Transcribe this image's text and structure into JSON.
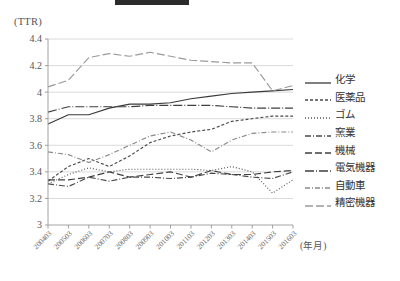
{
  "redaction": {
    "present": true
  },
  "axis": {
    "y_unit_label": "(TTR)",
    "x_unit_label": "(年月)",
    "y_ticks": [
      "4.4",
      "4.2",
      "4",
      "3.8",
      "3.6",
      "3.4",
      "3.2",
      "3"
    ],
    "x_ticks": [
      "200403",
      "200503",
      "200603",
      "200703",
      "200803",
      "200903",
      "201003",
      "201103",
      "201203",
      "201303",
      "201403",
      "201503",
      "201603"
    ]
  },
  "legend": {
    "items": [
      {
        "label": "化学",
        "key": "solid"
      },
      {
        "label": "医薬品",
        "key": "dashed-short"
      },
      {
        "label": "ゴム",
        "key": "dotted"
      },
      {
        "label": "窯業",
        "key": "dash-dot"
      },
      {
        "label": "機械",
        "key": "dashed-long"
      },
      {
        "label": "電気機器",
        "key": "long-dash-dot"
      },
      {
        "label": "自動車",
        "key": "dash-dot-gray"
      },
      {
        "label": "精密機器",
        "key": "dashed-wide-gray"
      }
    ]
  },
  "chart_data": {
    "type": "line",
    "title": "",
    "xlabel": "(年月)",
    "ylabel": "(TTR)",
    "ylim": [
      3.0,
      4.4
    ],
    "grid": true,
    "legend_position": "right",
    "x": [
      "200403",
      "200503",
      "200603",
      "200703",
      "200803",
      "200903",
      "201003",
      "201103",
      "201203",
      "201303",
      "201403",
      "201503",
      "201603"
    ],
    "series": [
      {
        "name": "化学",
        "color": "#3a3a3a",
        "dash": "none",
        "values": [
          3.76,
          3.83,
          3.83,
          3.88,
          3.91,
          3.91,
          3.92,
          3.95,
          3.97,
          3.99,
          4.0,
          4.01,
          4.02
        ]
      },
      {
        "name": "医薬品",
        "color": "#4a4a4a",
        "dash": "3,2",
        "values": [
          3.33,
          3.44,
          3.5,
          3.44,
          3.52,
          3.62,
          3.67,
          3.7,
          3.72,
          3.78,
          3.8,
          3.82,
          3.82
        ]
      },
      {
        "name": "ゴム",
        "color": "#555555",
        "dash": "1,2",
        "values": [
          3.31,
          3.38,
          3.43,
          3.4,
          3.42,
          3.42,
          3.42,
          3.42,
          3.41,
          3.44,
          3.4,
          3.24,
          3.34
        ]
      },
      {
        "name": "窯業",
        "color": "#4a4a4a",
        "dash": "6,2,1,2",
        "values": [
          3.31,
          3.29,
          3.36,
          3.33,
          3.36,
          3.36,
          3.35,
          3.36,
          3.39,
          3.38,
          3.36,
          3.35,
          3.4
        ]
      },
      {
        "name": "機械",
        "color": "#3f3f3f",
        "dash": "7,3",
        "values": [
          3.34,
          3.34,
          3.36,
          3.4,
          3.36,
          3.38,
          3.4,
          3.36,
          3.41,
          3.38,
          3.38,
          3.4,
          3.41
        ]
      },
      {
        "name": "電気機器",
        "color": "#3f3f3f",
        "dash": "9,2,1,2",
        "values": [
          3.85,
          3.89,
          3.89,
          3.89,
          3.89,
          3.9,
          3.9,
          3.9,
          3.9,
          3.89,
          3.88,
          3.88,
          3.88
        ]
      },
      {
        "name": "自動車",
        "color": "#8a8a8a",
        "dash": "5,2,1,2",
        "values": [
          3.55,
          3.53,
          3.47,
          3.53,
          3.6,
          3.67,
          3.7,
          3.64,
          3.55,
          3.64,
          3.69,
          3.7,
          3.7
        ]
      },
      {
        "name": "精密機器",
        "color": "#9a9a9a",
        "dash": "8,3",
        "values": [
          4.04,
          4.09,
          4.26,
          4.29,
          4.27,
          4.3,
          4.27,
          4.24,
          4.23,
          4.22,
          4.22,
          4.01,
          4.05
        ]
      }
    ]
  }
}
